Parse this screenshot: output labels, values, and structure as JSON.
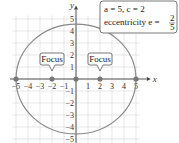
{
  "chart_data": {
    "type": "line",
    "title": "",
    "xlabel": "x",
    "ylabel": "y",
    "xlim": [
      -5,
      5
    ],
    "ylim": [
      -5,
      5
    ],
    "grid": true,
    "x_ticks": [
      -5,
      -4,
      -3,
      -2,
      -1,
      1,
      2,
      3,
      4,
      5
    ],
    "y_ticks": [
      -5,
      -4,
      -3,
      -2,
      -1,
      1,
      2,
      3,
      4,
      5
    ],
    "ellipse": {
      "a": 5,
      "b": 4.58,
      "center": [
        0,
        0
      ]
    },
    "points": [
      {
        "name": "vertex-left",
        "x": -5,
        "y": 0
      },
      {
        "name": "focus-left",
        "x": -2,
        "y": 0
      },
      {
        "name": "center",
        "x": 0,
        "y": 0
      },
      {
        "name": "focus-right",
        "x": 2,
        "y": 0
      },
      {
        "name": "vertex-right",
        "x": 5,
        "y": 0
      }
    ],
    "annotations": [
      {
        "label": "Focus",
        "x": -2,
        "y": 0
      },
      {
        "label": "Focus",
        "x": 2,
        "y": 0
      }
    ],
    "info_box": {
      "line1": "a = 5, c = 2",
      "line2_prefix": "eccentricity e = ",
      "frac_num": "2",
      "frac_den": "5"
    }
  },
  "colors": {
    "grid": "#d6d6d6",
    "axis": "#444444",
    "ellipse": "#8a8a8a",
    "point": "#777777"
  }
}
